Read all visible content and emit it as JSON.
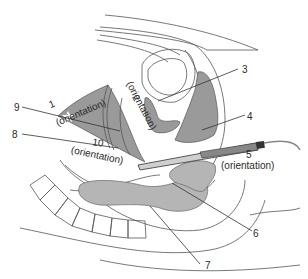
{
  "diagram": {
    "type": "anatomical cross-section with transvaginal ultrasound probe",
    "colors": {
      "background": "#ffffff",
      "organ_shade": "#9a9a9a",
      "light_shade": "#b5b5b5",
      "line": "#555555",
      "text": "#2a2a2a"
    },
    "labels": [
      {
        "id": "1",
        "number": "1",
        "note": "(orientation)"
      },
      {
        "id": "2",
        "number": "2",
        "note": "(orientation)"
      },
      {
        "id": "3",
        "number": "3",
        "note": ""
      },
      {
        "id": "4",
        "number": "4",
        "note": ""
      },
      {
        "id": "5",
        "number": "5",
        "note": "(orientation)"
      },
      {
        "id": "6",
        "number": "6",
        "note": ""
      },
      {
        "id": "7",
        "number": "7",
        "note": ""
      },
      {
        "id": "8",
        "number": "8",
        "note": ""
      },
      {
        "id": "9",
        "number": "9",
        "note": ""
      },
      {
        "id": "10",
        "number": "10",
        "note": "(orientation)"
      }
    ]
  }
}
